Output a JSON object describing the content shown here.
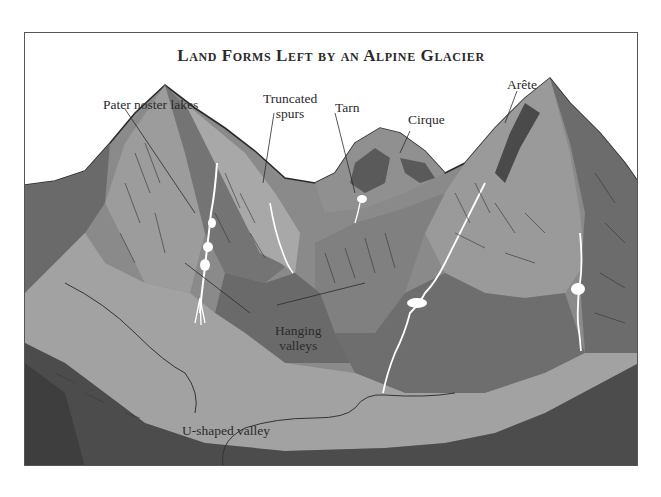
{
  "figure": {
    "title": "Land Forms Left by an Alpine Glacier",
    "labels": [
      {
        "id": "pater-noster-lakes",
        "text": "Pater noster lakes"
      },
      {
        "id": "truncated-spurs",
        "line1": "Truncated",
        "line2": "spurs"
      },
      {
        "id": "tarn",
        "text": "Tarn"
      },
      {
        "id": "cirque",
        "text": "Cirque"
      },
      {
        "id": "arete",
        "text": "Arête"
      },
      {
        "id": "hanging-valleys",
        "line1": "Hanging",
        "line2": "valleys"
      },
      {
        "id": "u-shaped-valley",
        "text": "U-shaped valley"
      }
    ],
    "colors": {
      "light_slope": "#9a9a9a",
      "mid_slope": "#7d7d7d",
      "dark_slope": "#5e5e5e",
      "valley_floor": "#a4a4a4",
      "foreground_dark": "#4a4a4a",
      "water": "#ffffff",
      "outline": "#2b2b2b"
    }
  }
}
